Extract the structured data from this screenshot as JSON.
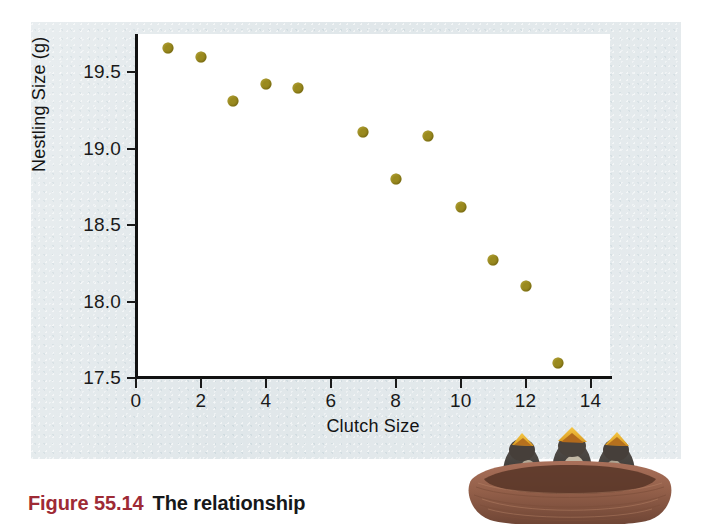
{
  "figure": {
    "caption_number": "Figure 55.14",
    "caption_text": "The relationship",
    "caption_number_color": "#9e2a35",
    "panel_background_color": "#dfe6e9",
    "photo_alt": "three nestling birds with open yellow beaks in a brown nest"
  },
  "chart_data": {
    "type": "scatter",
    "title": "",
    "xlabel": "Clutch Size",
    "ylabel": "Nestling Size (g)",
    "xlim": [
      0,
      14.6
    ],
    "ylim": [
      17.5,
      19.75
    ],
    "xticks": [
      "0",
      "2",
      "4",
      "6",
      "8",
      "10",
      "12",
      "14"
    ],
    "xtick_values": [
      0,
      2,
      4,
      6,
      8,
      10,
      12,
      14
    ],
    "yticks": [
      "17.5",
      "18.0",
      "18.5",
      "19.0",
      "19.5"
    ],
    "ytick_values": [
      17.5,
      18.0,
      18.5,
      19.0,
      19.5
    ],
    "grid": false,
    "legend": null,
    "marker_color": "#9a8a1f",
    "series": [
      {
        "name": "Nestling size vs clutch size",
        "x": [
          1,
          2,
          3,
          4,
          5,
          7,
          8,
          9,
          10,
          11,
          12,
          13
        ],
        "y": [
          19.66,
          19.6,
          19.31,
          19.42,
          19.4,
          19.11,
          18.8,
          19.08,
          18.62,
          18.27,
          18.1,
          17.6
        ]
      }
    ]
  }
}
